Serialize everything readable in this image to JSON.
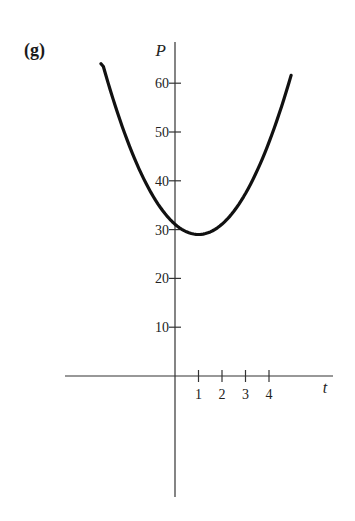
{
  "panel_label": "(g)",
  "colors": {
    "axis": "#333333",
    "curve": "#111111",
    "text": "#222222",
    "background": "#ffffff"
  },
  "chart_data": {
    "type": "line",
    "title": "",
    "xlabel": "t",
    "ylabel": "P",
    "xlim": [
      -4.7,
      6.7
    ],
    "ylim": [
      -24.6,
      68.6
    ],
    "x_ticks": [
      1,
      2,
      3,
      4
    ],
    "x_tick_labels": [
      "1",
      "2",
      "3",
      "4"
    ],
    "y_ticks": [
      10,
      20,
      30,
      40,
      50,
      60
    ],
    "y_tick_labels": [
      "10",
      "20",
      "30",
      "40",
      "50",
      "60"
    ],
    "grid": false,
    "legend": null,
    "series": [
      {
        "name": "P(t)",
        "description": "Upward parabola with minimum near t = 1, P ≈ 29; crosses P-axis near 31",
        "x": [
          -3.15,
          -2.5,
          -2,
          -1.5,
          -1,
          -0.5,
          0,
          0.5,
          1,
          1.5,
          2,
          2.5,
          3,
          3.5,
          4,
          4.5,
          4.94
        ],
        "values": [
          64,
          55.4,
          47.9,
          42.1,
          37.4,
          33.7,
          31.1,
          29.5,
          29,
          29.5,
          31.1,
          33.7,
          37.4,
          42.1,
          47.9,
          55.1,
          62.7
        ]
      }
    ]
  }
}
